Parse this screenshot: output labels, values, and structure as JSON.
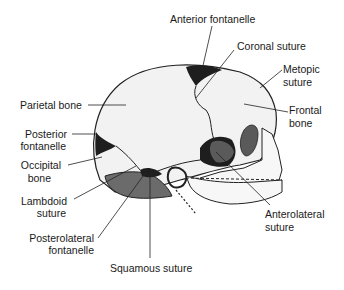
{
  "diagram": {
    "colors": {
      "bone": "#f2f2f2",
      "outline": "#222222",
      "fontanelle": "#1e1e1e",
      "shaded_bone": "#6b6b6b",
      "orbit": "#5a5a5a"
    },
    "labels": {
      "anterior_fontanelle": "Anterior fontanelle",
      "coronal_suture": "Coronal suture",
      "metopic_suture_1": "Metopic",
      "metopic_suture_2": "suture",
      "parietal_bone": "Parietal bone",
      "frontal_bone_1": "Frontal",
      "frontal_bone_2": "bone",
      "posterior_fontanelle_1": "Posterior",
      "posterior_fontanelle_2": "fontanelle",
      "occipital_bone_1": "Occipital",
      "occipital_bone_2": "bone",
      "lambdoid_suture_1": "Lambdoid",
      "lambdoid_suture_2": "suture",
      "anterolateral_suture_1": "Anterolateral",
      "anterolateral_suture_2": "suture",
      "posterolateral_fontanelle_1": "Posterolateral",
      "posterolateral_fontanelle_2": "fontanelle",
      "squamous_suture": "Squamous suture"
    }
  }
}
